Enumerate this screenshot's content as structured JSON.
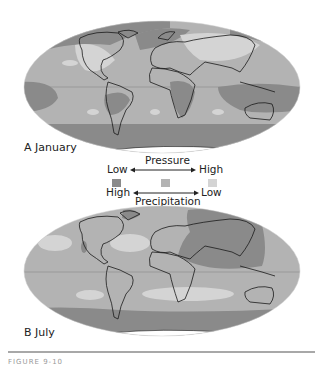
{
  "figure": {
    "panels": [
      {
        "id": "A",
        "label": "A  January"
      },
      {
        "id": "B",
        "label": "B  July"
      }
    ],
    "legend": {
      "pressure_title": "Pressure",
      "precipitation_title": "Precipitation",
      "pressure_low": "Low",
      "pressure_high": "High",
      "precip_high": "High",
      "precip_low": "Low",
      "swatches": [
        {
          "name": "low-pressure-high-precip",
          "color": "#8a8a8a"
        },
        {
          "name": "medium",
          "color": "#b3b3b3"
        },
        {
          "name": "high-pressure-low-precip",
          "color": "#d4d4d4"
        }
      ]
    },
    "colors": {
      "dark": "#8a8a8a",
      "medium": "#b3b3b3",
      "light": "#d4d4d4",
      "coast": "#1a1a1a",
      "ice": "#ffffff"
    },
    "caption": "FIGURE 9-10"
  }
}
